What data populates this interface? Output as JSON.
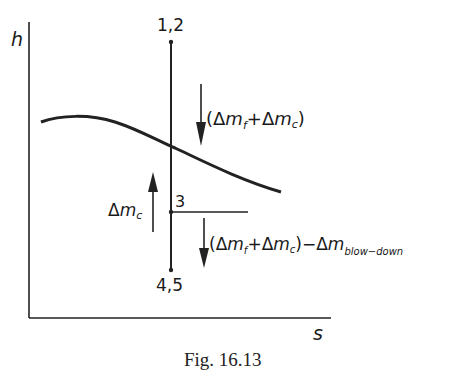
{
  "axes": {
    "y_label": "h",
    "x_label": "s"
  },
  "points": {
    "top": "1,2",
    "middle": "3",
    "bottom": "4,5"
  },
  "annotations": {
    "down_upper": {
      "open": "(",
      "d1": "Δ",
      "m1": "m",
      "s1": "f",
      "plus": "+",
      "d2": "Δ",
      "m2": "m",
      "s2": "c",
      "close": ")"
    },
    "up_left": {
      "d": "Δ",
      "m": "m",
      "s": "c"
    },
    "down_lower": {
      "open": "(",
      "d1": "Δ",
      "m1": "m",
      "s1": "f",
      "plus": "+",
      "d2": "Δ",
      "m2": "m",
      "s2": "c",
      "close": ")",
      "minus": "−",
      "d3": "Δ",
      "m3": "m",
      "s3": "blow−down"
    }
  },
  "caption": "Fig. 16.13"
}
